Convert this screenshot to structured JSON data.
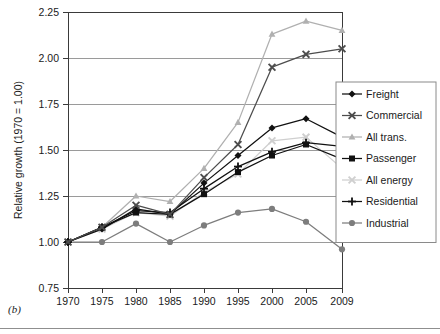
{
  "figure": {
    "panel_label": "(b)",
    "background_color": "#ffffff"
  },
  "chart_data": {
    "type": "line",
    "title": "",
    "xlabel": "",
    "ylabel": "Relative growth (1970 = 1.00)",
    "x": [
      1970,
      1975,
      1980,
      1985,
      1990,
      1995,
      2000,
      2005,
      2009
    ],
    "xtick_labels": [
      "1970",
      "1975",
      "1980",
      "1985",
      "1990",
      "1995",
      "2000",
      "2005",
      "2009"
    ],
    "ytick_labels": [
      "0.75",
      "1.00",
      "1.25",
      "1.50",
      "1.75",
      "2.00",
      "2.25"
    ],
    "ytick_values": [
      0.75,
      1.0,
      1.25,
      1.5,
      1.75,
      2.0,
      2.25
    ],
    "ylim": [
      0.75,
      2.25
    ],
    "grid": "horizontal",
    "legend_position": "right",
    "series": [
      {
        "name": "Freight",
        "marker": "diamond",
        "color": "#111111",
        "values": [
          1.0,
          1.07,
          1.18,
          1.15,
          1.32,
          1.47,
          1.62,
          1.67,
          1.57
        ]
      },
      {
        "name": "Commercial",
        "marker": "x",
        "color": "#4d4d4d",
        "values": [
          1.0,
          1.08,
          1.2,
          1.15,
          1.35,
          1.53,
          1.95,
          2.02,
          2.05
        ]
      },
      {
        "name": "All trans.",
        "marker": "triangle",
        "color": "#b0b0b0",
        "values": [
          1.0,
          1.08,
          1.25,
          1.22,
          1.4,
          1.65,
          2.13,
          2.2,
          2.15
        ]
      },
      {
        "name": "Passenger",
        "marker": "square",
        "color": "#111111",
        "values": [
          1.0,
          1.08,
          1.16,
          1.15,
          1.26,
          1.38,
          1.47,
          1.53,
          1.45
        ]
      },
      {
        "name": "All energy",
        "marker": "x",
        "color": "#cfcfcf",
        "values": [
          1.0,
          1.07,
          1.16,
          1.14,
          1.27,
          1.37,
          1.55,
          1.57,
          1.4
        ]
      },
      {
        "name": "Residential",
        "marker": "plus",
        "color": "#111111",
        "values": [
          1.0,
          1.08,
          1.17,
          1.16,
          1.29,
          1.41,
          1.49,
          1.54,
          1.52
        ]
      },
      {
        "name": "Industrial",
        "marker": "circle",
        "color": "#7d7d7d",
        "values": [
          1.0,
          1.0,
          1.1,
          1.0,
          1.09,
          1.16,
          1.18,
          1.11,
          0.96
        ]
      }
    ]
  }
}
